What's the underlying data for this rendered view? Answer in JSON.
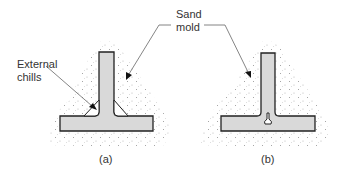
{
  "figure": {
    "labels": {
      "external_chills_line1": "External",
      "external_chills_line2": "chills",
      "sand_mold_line1": "Sand",
      "sand_mold_line2": "mold",
      "caption_a": "(a)",
      "caption_b": "(b)"
    },
    "colors": {
      "casting_fill": "#d9d9d9",
      "outline": "#222222",
      "sand_dots": "#888888",
      "leader": "#666666"
    }
  }
}
